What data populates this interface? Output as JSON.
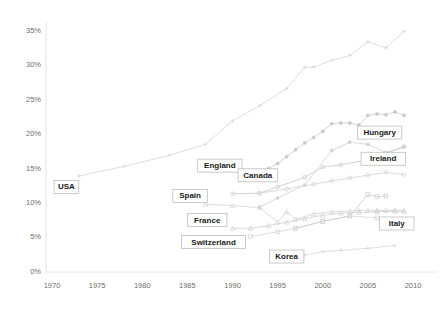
{
  "chart_data": {
    "type": "line",
    "title": "",
    "subtitle": "",
    "xlabel": "",
    "ylabel": "",
    "xlim": [
      1970,
      2011
    ],
    "ylim": [
      0,
      35
    ],
    "grid": false,
    "legend_position": "inline-labels",
    "x_ticks": [
      1970,
      1975,
      1980,
      1985,
      1990,
      1995,
      2000,
      2005,
      2010
    ],
    "x_tick_labels": [
      "1970",
      "1975",
      "1980",
      "1985",
      "1990",
      "1995",
      "2000",
      "2005",
      "2010"
    ],
    "y_ticks": [
      0,
      5,
      10,
      15,
      20,
      25,
      30,
      35
    ],
    "y_tick_labels": [
      "0%",
      "5%",
      "10%",
      "15%",
      "20%",
      "25%",
      "30%",
      "35%"
    ],
    "series": [
      {
        "name": "USA",
        "color": "#d4d4d4",
        "marker": "cross",
        "label_anchor": {
          "x": 1971.6,
          "y": 12.2
        },
        "points": [
          {
            "x": 1973,
            "y": 13.8
          },
          {
            "x": 1978,
            "y": 15.2
          },
          {
            "x": 1983,
            "y": 16.8
          },
          {
            "x": 1987,
            "y": 18.4
          },
          {
            "x": 1990,
            "y": 21.8
          },
          {
            "x": 1993,
            "y": 24.0
          },
          {
            "x": 1996,
            "y": 26.5
          },
          {
            "x": 1998,
            "y": 29.6
          },
          {
            "x": 1999,
            "y": 29.6
          },
          {
            "x": 2001,
            "y": 30.6
          },
          {
            "x": 2003,
            "y": 31.3
          },
          {
            "x": 2005,
            "y": 33.3
          },
          {
            "x": 2007,
            "y": 32.4
          },
          {
            "x": 2009,
            "y": 34.8
          }
        ]
      },
      {
        "name": "Hungary",
        "color": "#c9c9c9",
        "marker": "dot",
        "label_anchor": {
          "x": 2006.3,
          "y": 20.1
        },
        "points": [
          {
            "x": 1991,
            "y": 14.4
          },
          {
            "x": 1992,
            "y": 14.4
          },
          {
            "x": 1993,
            "y": 14.4
          },
          {
            "x": 1994,
            "y": 14.9
          },
          {
            "x": 1995,
            "y": 15.6
          },
          {
            "x": 1996,
            "y": 16.6
          },
          {
            "x": 1997,
            "y": 17.6
          },
          {
            "x": 1998,
            "y": 18.6
          },
          {
            "x": 1999,
            "y": 19.4
          },
          {
            "x": 2000,
            "y": 20.3
          },
          {
            "x": 2001,
            "y": 21.4
          },
          {
            "x": 2002,
            "y": 21.5
          },
          {
            "x": 2003,
            "y": 21.5
          },
          {
            "x": 2004,
            "y": 21.2
          },
          {
            "x": 2005,
            "y": 22.6
          },
          {
            "x": 2006,
            "y": 22.8
          },
          {
            "x": 2007,
            "y": 22.7
          },
          {
            "x": 2008,
            "y": 23.1
          },
          {
            "x": 2009,
            "y": 22.6
          }
        ]
      },
      {
        "name": "England",
        "color": "#d2d2d2",
        "marker": "dot",
        "label_anchor": {
          "x": 1988.6,
          "y": 15.3
        },
        "points": [
          {
            "x": 1993,
            "y": 9.3
          },
          {
            "x": 1995,
            "y": 10.6
          },
          {
            "x": 1998,
            "y": 12.5
          },
          {
            "x": 2001,
            "y": 17.5
          },
          {
            "x": 2003,
            "y": 18.7
          },
          {
            "x": 2005,
            "y": 18.4
          },
          {
            "x": 2007,
            "y": 17.2
          },
          {
            "x": 2009,
            "y": 18.1
          }
        ]
      },
      {
        "name": "Ireland",
        "color": "#c7c7c7",
        "marker": "circle",
        "label_anchor": {
          "x": 2006.7,
          "y": 16.3
        },
        "points": [
          {
            "x": 1990,
            "y": 11.2
          },
          {
            "x": 1993,
            "y": 11.3
          },
          {
            "x": 1995,
            "y": 12.2
          },
          {
            "x": 1998,
            "y": 13.6
          },
          {
            "x": 2000,
            "y": 15.1
          },
          {
            "x": 2002,
            "y": 15.4
          },
          {
            "x": 2005,
            "y": 16.2
          },
          {
            "x": 2007,
            "y": 17.1
          },
          {
            "x": 2009,
            "y": 18.0
          }
        ]
      },
      {
        "name": "Canada",
        "color": "#d0d0d0",
        "marker": "circle",
        "label_anchor": {
          "x": 1992.8,
          "y": 13.9
        },
        "points": [
          {
            "x": 1993,
            "y": 11.3
          },
          {
            "x": 1996,
            "y": 11.9
          },
          {
            "x": 1999,
            "y": 12.6
          },
          {
            "x": 2001,
            "y": 13.1
          },
          {
            "x": 2003,
            "y": 13.5
          },
          {
            "x": 2005,
            "y": 13.9
          },
          {
            "x": 2007,
            "y": 14.3
          },
          {
            "x": 2009,
            "y": 14.0
          }
        ]
      },
      {
        "name": "Spain",
        "color": "#d4d4d4",
        "marker": "triangle",
        "label_anchor": {
          "x": 1985.3,
          "y": 10.9
        },
        "points": [
          {
            "x": 1987,
            "y": 9.7
          },
          {
            "x": 1990,
            "y": 9.5
          },
          {
            "x": 1993,
            "y": 9.2
          },
          {
            "x": 1995,
            "y": 7.1
          },
          {
            "x": 1996,
            "y": 8.6
          },
          {
            "x": 1997,
            "y": 7.5
          },
          {
            "x": 1999,
            "y": 8.3
          },
          {
            "x": 2001,
            "y": 8.6
          },
          {
            "x": 2003,
            "y": 8.7
          },
          {
            "x": 2004,
            "y": 8.8
          },
          {
            "x": 2005,
            "y": 8.8
          },
          {
            "x": 2006,
            "y": 8.8
          },
          {
            "x": 2007,
            "y": 8.8
          },
          {
            "x": 2008,
            "y": 8.8
          },
          {
            "x": 2009,
            "y": 8.7
          }
        ]
      },
      {
        "name": "France",
        "color": "#cfcfcf",
        "marker": "triangle",
        "label_anchor": {
          "x": 1987.2,
          "y": 7.4
        },
        "points": [
          {
            "x": 1990,
            "y": 6.2
          },
          {
            "x": 1992,
            "y": 6.2
          },
          {
            "x": 1994,
            "y": 6.6
          },
          {
            "x": 1996,
            "y": 7.1
          },
          {
            "x": 1998,
            "y": 7.6
          },
          {
            "x": 2000,
            "y": 8.1
          },
          {
            "x": 2002,
            "y": 8.4
          },
          {
            "x": 2004,
            "y": 8.5
          },
          {
            "x": 2006,
            "y": 8.6
          },
          {
            "x": 2008,
            "y": 8.7
          },
          {
            "x": 2009,
            "y": 8.7
          }
        ]
      },
      {
        "name": "Italy",
        "color": "#cacaca",
        "marker": "square",
        "label_anchor": {
          "x": 2008.2,
          "y": 6.9
        },
        "points": [
          {
            "x": 1997,
            "y": 6.2
          },
          {
            "x": 2000,
            "y": 7.2
          },
          {
            "x": 2003,
            "y": 8.0
          },
          {
            "x": 2005,
            "y": 11.1
          },
          {
            "x": 2006,
            "y": 10.8
          },
          {
            "x": 2007,
            "y": 10.9
          }
        ]
      },
      {
        "name": "Switzerland",
        "color": "#d3d3d3",
        "marker": "square",
        "label_anchor": {
          "x": 1987.9,
          "y": 4.2
        },
        "points": [
          {
            "x": 1992,
            "y": 5.0
          },
          {
            "x": 1995,
            "y": 5.7
          },
          {
            "x": 1997,
            "y": 6.2
          },
          {
            "x": 2000,
            "y": 7.2
          },
          {
            "x": 2003,
            "y": 8.0
          },
          {
            "x": 2006,
            "y": 7.7
          }
        ]
      },
      {
        "name": "Korea",
        "color": "#d6d6d6",
        "marker": "cross",
        "label_anchor": {
          "x": 1996.0,
          "y": 2.1
        },
        "points": [
          {
            "x": 1998,
            "y": 2.3
          },
          {
            "x": 2000,
            "y": 2.8
          },
          {
            "x": 2002,
            "y": 3.0
          },
          {
            "x": 2005,
            "y": 3.3
          },
          {
            "x": 2008,
            "y": 3.7
          }
        ]
      }
    ]
  },
  "axes": {
    "left_spine_color": "#dddddd",
    "bottom_spine_color": "#dddddd"
  }
}
